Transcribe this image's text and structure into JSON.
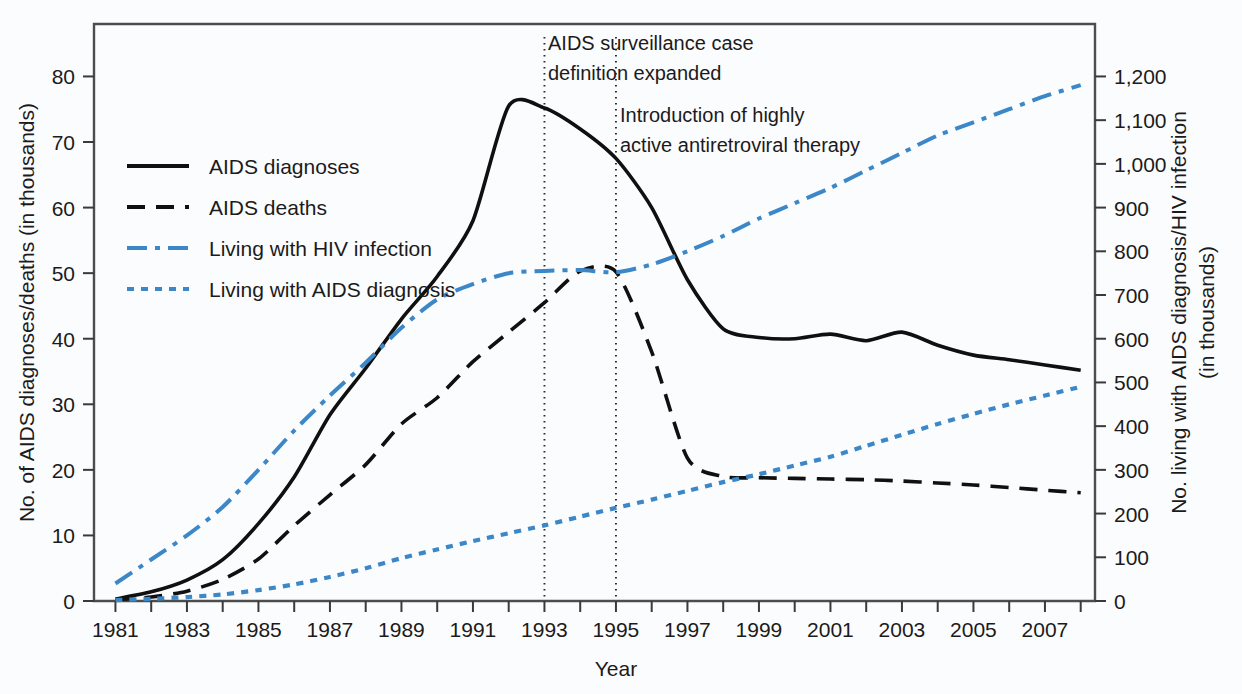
{
  "chart_data": {
    "type": "line",
    "title": "",
    "xlabel": "Year",
    "ylabel": "No. of AIDS diagnoses/deaths (in thousands)",
    "y2label": "No. living with AIDS diagnosis/HIV infection (in thousands)",
    "x": [
      1981,
      1982,
      1983,
      1984,
      1985,
      1986,
      1987,
      1988,
      1989,
      1990,
      1991,
      1992,
      1993,
      1994,
      1995,
      1996,
      1997,
      1998,
      1999,
      2000,
      2001,
      2002,
      2003,
      2004,
      2005,
      2006,
      2007,
      2008
    ],
    "xlim": [
      1980.4,
      2008.4
    ],
    "ylim": [
      0,
      88
    ],
    "y2lim": [
      0,
      1320
    ],
    "yticks": [
      0,
      10,
      20,
      30,
      40,
      50,
      60,
      70,
      80
    ],
    "ytick_labels": [
      "0",
      "10",
      "20",
      "30",
      "40",
      "50",
      "60",
      "70",
      "80"
    ],
    "y2ticks": [
      0,
      100,
      200,
      300,
      400,
      500,
      600,
      700,
      800,
      900,
      1000,
      1100,
      1200
    ],
    "y2tick_labels": [
      "0",
      "100",
      "200",
      "300",
      "400",
      "500",
      "600",
      "700",
      "800",
      "900",
      "1,000",
      "1,100",
      "1,200"
    ],
    "xticks": [
      1981,
      1982,
      1983,
      1984,
      1985,
      1986,
      1987,
      1988,
      1989,
      1990,
      1991,
      1992,
      1993,
      1994,
      1995,
      1996,
      1997,
      1998,
      1999,
      2000,
      2001,
      2002,
      2003,
      2004,
      2005,
      2006,
      2007,
      2008
    ],
    "xtick_labels": [
      "1981",
      "",
      "1983",
      "",
      "1985",
      "",
      "1987",
      "",
      "1989",
      "",
      "1991",
      "",
      "1993",
      "",
      "1995",
      "",
      "1997",
      "",
      "1999",
      "",
      "2001",
      "",
      "2003",
      "",
      "2005",
      "",
      "2007",
      ""
    ],
    "grid": false,
    "legend_position": "upper-left-inside",
    "series": [
      {
        "name": "AIDS diagnoses",
        "axis": "left",
        "color": "#101010",
        "style": "solid",
        "values": [
          0.3,
          1.4,
          3.2,
          6.3,
          11.8,
          18.9,
          28.4,
          35.5,
          43.0,
          49.5,
          58.0,
          75.5,
          75.2,
          72.0,
          67.5,
          60.0,
          49.0,
          41.5,
          40.2,
          40.0,
          40.7,
          39.7,
          41.0,
          39.0,
          37.5,
          36.8,
          36.0,
          35.2
        ]
      },
      {
        "name": "AIDS deaths",
        "axis": "left",
        "color": "#101010",
        "style": "dashed",
        "values": [
          0.2,
          0.6,
          1.5,
          3.3,
          6.4,
          11.5,
          16.2,
          20.8,
          27.0,
          31.0,
          36.5,
          41.0,
          45.5,
          50.3,
          50.2,
          38.0,
          21.8,
          19.0,
          18.8,
          18.7,
          18.6,
          18.5,
          18.3,
          18.0,
          17.7,
          17.3,
          16.9,
          16.5
        ]
      },
      {
        "name": "Living with HIV infection",
        "axis": "right",
        "color": "#3b87c8",
        "style": "dash-dot",
        "values": [
          40,
          95,
          150,
          215,
          300,
          390,
          470,
          545,
          625,
          690,
          725,
          750,
          755,
          757,
          752,
          770,
          800,
          835,
          875,
          910,
          945,
          985,
          1025,
          1065,
          1095,
          1125,
          1155,
          1180
        ]
      },
      {
        "name": "Living with AIDS diagnosis",
        "axis": "right",
        "color": "#3b87c8",
        "style": "dotted",
        "values": [
          2,
          5,
          9,
          15,
          25,
          38,
          55,
          75,
          98,
          118,
          137,
          155,
          173,
          193,
          213,
          232,
          252,
          272,
          290,
          310,
          330,
          355,
          380,
          405,
          428,
          450,
          470,
          490
        ]
      }
    ],
    "annotations": [
      {
        "text_lines": [
          "AIDS surveillance case",
          "definition expanded"
        ],
        "vline_x": 1993
      },
      {
        "text_lines": [
          "Introduction of highly",
          "active antiretroviral therapy"
        ],
        "vline_x": 1995
      }
    ]
  },
  "legend": {
    "items": [
      {
        "label": "AIDS diagnoses"
      },
      {
        "label": "AIDS deaths"
      },
      {
        "label": "Living with HIV infection"
      },
      {
        "label": "Living with AIDS diagnosis"
      }
    ]
  },
  "colors": {
    "blue": "#3b87c8",
    "black": "#101010",
    "frame": "#4d4d4d",
    "background": "#fbfcfd"
  }
}
